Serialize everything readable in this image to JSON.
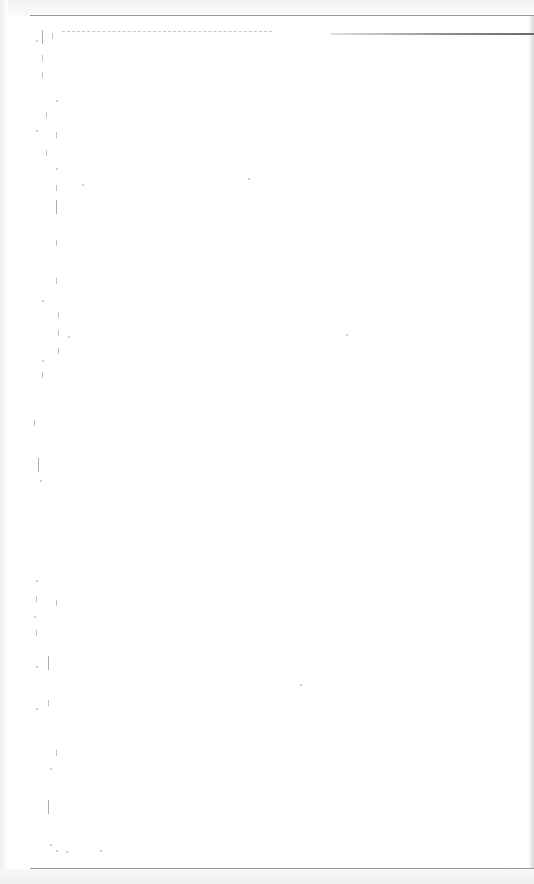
{
  "page": {
    "header_text": "",
    "body_text": "",
    "footer_text": "",
    "legible_content": false
  },
  "colors": {
    "paper": "#ffffff",
    "rule": "#9a9a9a",
    "scan_marks": "#8c8c8c"
  }
}
